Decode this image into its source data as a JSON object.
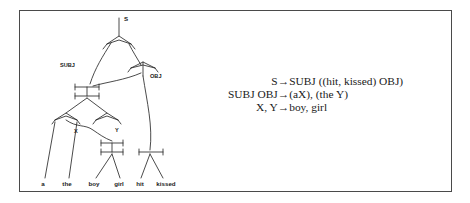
{
  "figure": {
    "caption_none": "",
    "border_color": "#4a4a4a",
    "ink_color": "#2b2b2b",
    "background": "#ffffff"
  },
  "tree": {
    "title": "dependency-tree-diagram",
    "internal_labels": [
      {
        "id": "s",
        "text": "S"
      },
      {
        "id": "subj",
        "text": "SUBJ"
      },
      {
        "id": "obj",
        "text": "OBJ"
      },
      {
        "id": "x",
        "text": "X"
      },
      {
        "id": "y",
        "text": "Y"
      }
    ],
    "leaves": [
      {
        "id": "leaf-a",
        "text": "a"
      },
      {
        "id": "leaf-the",
        "text": "the"
      },
      {
        "id": "leaf-boy",
        "text": "boy"
      },
      {
        "id": "leaf-girl",
        "text": "girl"
      },
      {
        "id": "leaf-hit",
        "text": "hit"
      },
      {
        "id": "leaf-kissed",
        "text": "kissed"
      }
    ]
  },
  "rules": {
    "arrow_glyph": "→",
    "items": [
      {
        "lhs": "S",
        "arrow": "→",
        "rhs": "SUBJ ((hit, kissed) OBJ)"
      },
      {
        "lhs": "SUBJ OBJ",
        "arrow": "→",
        "rhs": "(aX), (the Y)"
      },
      {
        "lhs": "X, Y",
        "arrow": "→",
        "rhs": "boy, girl"
      }
    ]
  }
}
